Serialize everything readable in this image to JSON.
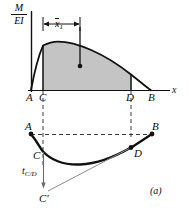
{
  "figure": {
    "figure_label": "(a)",
    "axis_label_vertical_numerator": "M",
    "axis_label_vertical_denominator": "EI",
    "axis_label_horizontal": "x",
    "dimension_label_base": "x",
    "dimension_label_subscript": "1",
    "deviation_label_base": "t",
    "deviation_label_subscript": "C/D",
    "colors": {
      "curve": "#111111",
      "axis": "#111111",
      "shaded_area": "#c4c4c4",
      "dashed_guide": "#3a3a3a",
      "tangent_line": "#8a8a8a",
      "background": "#ffffff"
    },
    "top_diagram": {
      "name": "M over EI diagram",
      "points": [
        {
          "label": "A",
          "x": 30,
          "y": 90
        },
        {
          "label": "C",
          "x": 43,
          "y": 90
        },
        {
          "label": "D",
          "x": 131,
          "y": 90
        },
        {
          "label": "B",
          "x": 151,
          "y": 90
        }
      ],
      "curve_peak_x": 58,
      "curve_peak_y": 42,
      "centroid_marker": {
        "x": 80,
        "y": 66
      },
      "shaded_region": "area under M/EI curve between C and D"
    },
    "bottom_diagram": {
      "name": "elastic curve deflection diagram",
      "points": [
        {
          "label": "A",
          "x": 31,
          "y": 134
        },
        {
          "label": "B",
          "x": 152,
          "y": 134
        },
        {
          "label": "C",
          "x": 43,
          "y": 151
        },
        {
          "label": "D",
          "x": 131,
          "y": 148
        }
      ],
      "tangent_endpoint": {
        "label": "C'",
        "x": 48,
        "y": 195
      }
    }
  }
}
